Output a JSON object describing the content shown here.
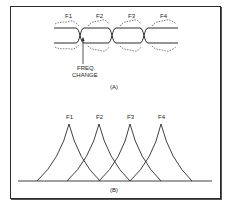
{
  "panel_a": {
    "caption": "(A)",
    "frequency_labels": [
      "F1",
      "F2",
      "F3",
      "F4"
    ],
    "annotation_line1": "FREQ.",
    "annotation_line2": "CHANGE"
  },
  "panel_b": {
    "caption": "(B)",
    "peak_labels": [
      "F1",
      "F2",
      "F3",
      "F4"
    ]
  },
  "colors": {
    "line": "#2a2a2a",
    "background": "#ffffff"
  }
}
